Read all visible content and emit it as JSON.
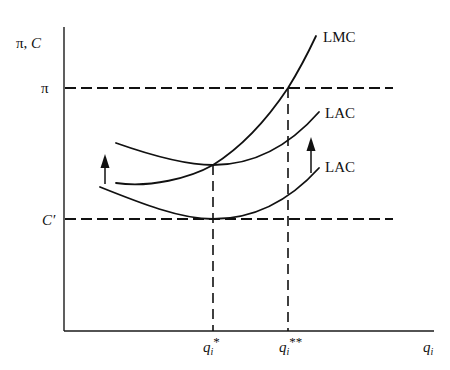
{
  "diagram": {
    "type": "economics-cost-curves",
    "y_axis_label": "π, C",
    "x_axis_label": "q",
    "x_axis_subscript": "i",
    "horizontal_levels": [
      {
        "id": "pi",
        "label": "π",
        "y": 88
      },
      {
        "id": "c-prime",
        "label": "C′",
        "y": 219
      }
    ],
    "vertical_markers": [
      {
        "id": "q-star",
        "label": "q",
        "subscript": "i",
        "superscript": "*",
        "x": 213
      },
      {
        "id": "q-double-star",
        "label": "q",
        "subscript": "i",
        "superscript": "**",
        "x": 288
      }
    ],
    "curves": [
      {
        "id": "lmc",
        "label": "LMC"
      },
      {
        "id": "lac-upper",
        "label": "LAC"
      },
      {
        "id": "lac-lower",
        "label": "LAC"
      }
    ],
    "arrows": [
      {
        "id": "shift-left",
        "direction": "up"
      },
      {
        "id": "shift-right",
        "direction": "up"
      }
    ],
    "colors": {
      "ink": "#111111",
      "background": "#ffffff"
    }
  }
}
